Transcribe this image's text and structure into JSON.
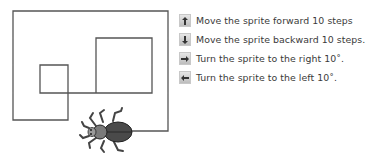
{
  "legend": {
    "items": [
      {
        "key": "up-arrow",
        "label": "Move the sprite forward 10 steps"
      },
      {
        "key": "down-arrow",
        "label": "Move the sprite backward 10 steps."
      },
      {
        "key": "right-arrow",
        "label": "Turn the sprite to the right 10˚."
      },
      {
        "key": "left-arrow",
        "label": "Turn the sprite to the left 10˚."
      }
    ]
  },
  "colors": {
    "path": "#555555",
    "path_light": "#8a8a8a",
    "beetle": "#4a4a4a",
    "text": "#3a3a3a"
  }
}
